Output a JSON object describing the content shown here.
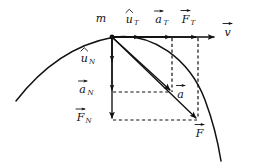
{
  "diagram": {
    "background_color": "#ffffff",
    "stroke_color": "#111111",
    "origin": {
      "x": 112,
      "y": 37,
      "label": "m"
    }
  },
  "labels": {
    "mass": "m",
    "unit_tangent": "u",
    "unit_tangent_sub": "T",
    "accel_tangential": "a",
    "accel_tangential_sub": "T",
    "force_tangential": "F",
    "force_tangential_sub": "T",
    "velocity": "v",
    "unit_normal": "u",
    "unit_normal_sub": "N",
    "accel_normal": "a",
    "accel_normal_sub": "N",
    "force_normal": "F",
    "force_normal_sub": "N",
    "accel_total": "a",
    "force_total": "F"
  },
  "vectors": [
    {
      "name": "unit-tangent-vector",
      "symbol": "u",
      "subscript": "T",
      "accent": "hat",
      "direction": "tangential",
      "from": {
        "x": 112,
        "y": 37
      },
      "to": {
        "x": 141,
        "y": 37
      },
      "label_pos": {
        "x": 128,
        "y": 19
      }
    },
    {
      "name": "tangential-acceleration-vector",
      "symbol": "a",
      "subscript": "T",
      "accent": "arrow",
      "direction": "tangential",
      "from": {
        "x": 112,
        "y": 37
      },
      "to": {
        "x": 172,
        "y": 37
      },
      "label_pos": {
        "x": 159,
        "y": 19
      }
    },
    {
      "name": "tangential-force-vector",
      "symbol": "F",
      "subscript": "T",
      "accent": "arrow",
      "direction": "tangential",
      "from": {
        "x": 112,
        "y": 37
      },
      "to": {
        "x": 198,
        "y": 37
      },
      "label_pos": {
        "x": 186,
        "y": 19
      }
    },
    {
      "name": "velocity-vector",
      "symbol": "v",
      "subscript": "",
      "accent": "arrow",
      "direction": "tangential",
      "from": {
        "x": 112,
        "y": 37
      },
      "to": {
        "x": 216,
        "y": 37
      },
      "label_pos": {
        "x": 227,
        "y": 22
      }
    },
    {
      "name": "unit-normal-vector",
      "symbol": "u",
      "subscript": "N",
      "accent": "hat",
      "direction": "normal",
      "from": {
        "x": 112,
        "y": 37
      },
      "to": {
        "x": 112,
        "y": 63
      },
      "label_pos": {
        "x": 84,
        "y": 58
      }
    },
    {
      "name": "normal-acceleration-vector",
      "symbol": "a",
      "subscript": "N",
      "accent": "arrow",
      "direction": "normal",
      "from": {
        "x": 112,
        "y": 37
      },
      "to": {
        "x": 112,
        "y": 92
      },
      "label_pos": {
        "x": 82,
        "y": 89
      }
    },
    {
      "name": "normal-force-vector",
      "symbol": "F",
      "subscript": "N",
      "accent": "arrow",
      "direction": "normal",
      "from": {
        "x": 112,
        "y": 37
      },
      "to": {
        "x": 112,
        "y": 120
      },
      "label_pos": {
        "x": 80,
        "y": 117
      }
    },
    {
      "name": "total-acceleration-vector",
      "symbol": "a",
      "subscript": "",
      "accent": "arrow",
      "direction": "resultant",
      "from": {
        "x": 112,
        "y": 37
      },
      "to": {
        "x": 172,
        "y": 92
      },
      "label_pos": {
        "x": 180,
        "y": 94
      }
    },
    {
      "name": "total-force-vector",
      "symbol": "F",
      "subscript": "",
      "accent": "arrow",
      "direction": "resultant",
      "from": {
        "x": 112,
        "y": 37
      },
      "to": {
        "x": 198,
        "y": 120
      },
      "label_pos": {
        "x": 199,
        "y": 133
      }
    }
  ],
  "construction_lines": [
    {
      "name": "dashed-vertical-to-accel",
      "style": "dashed",
      "from": {
        "x": 172,
        "y": 37
      },
      "to": {
        "x": 172,
        "y": 92
      }
    },
    {
      "name": "dashed-vertical-to-force",
      "style": "dashed",
      "from": {
        "x": 198,
        "y": 37
      },
      "to": {
        "x": 198,
        "y": 120
      }
    },
    {
      "name": "dashed-horizontal-to-accel",
      "style": "dashed",
      "from": {
        "x": 112,
        "y": 92
      },
      "to": {
        "x": 172,
        "y": 92
      }
    },
    {
      "name": "dashed-horizontal-to-force",
      "style": "dashed",
      "from": {
        "x": 112,
        "y": 120
      },
      "to": {
        "x": 198,
        "y": 120
      }
    }
  ],
  "trajectory": {
    "name": "particle-path-curve",
    "description": "Concave-down curved trajectory passing through the particle location",
    "path": "M 16,101 C 40,70 72,45 112,37.5 C 152,30.5 190,60 205,100 C 214,124 218,142 221,161"
  }
}
